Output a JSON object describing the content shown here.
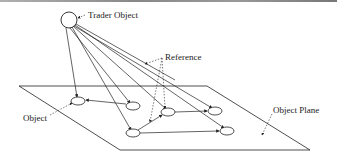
{
  "diagram": {
    "labels": {
      "trader": "Trader Object",
      "reference": "Reference",
      "object": "Object",
      "plane": "Object Plane"
    },
    "trader": {
      "cx": 69,
      "cy": 20,
      "r": 8
    },
    "plane": {
      "points": "19,86 207,86 310,150 120,150"
    },
    "objects": [
      {
        "id": "o1",
        "cx": 78,
        "cy": 101
      },
      {
        "id": "o2",
        "cx": 133,
        "cy": 106
      },
      {
        "id": "o3",
        "cx": 168,
        "cy": 112
      },
      {
        "id": "o4",
        "cx": 215,
        "cy": 111
      },
      {
        "id": "o5",
        "cx": 133,
        "cy": 133
      },
      {
        "id": "o6",
        "cx": 227,
        "cy": 131
      }
    ],
    "colors": {
      "line": "#222222",
      "background": "#ffffff"
    }
  }
}
